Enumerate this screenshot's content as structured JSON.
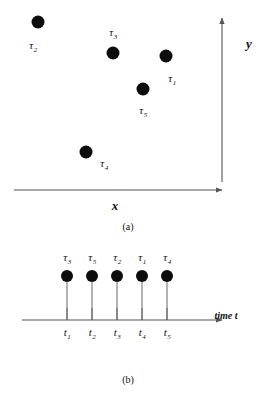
{
  "figure": {
    "background": "#ffffff",
    "ink": "#111111",
    "dot_color": "#0d0d0d",
    "axis_color": "#555555"
  },
  "panel_a": {
    "caption": "(a)",
    "x_axis_label": "x",
    "y_axis_label": "y",
    "points": [
      {
        "id": "tau-2",
        "label": "τ",
        "subscript": "2",
        "x": 38,
        "y": 22,
        "label_x": 33,
        "label_y": 45
      },
      {
        "id": "tau-3",
        "label": "τ",
        "subscript": "3",
        "x": 113,
        "y": 53,
        "label_x": 113,
        "label_y": 32
      },
      {
        "id": "tau-1",
        "label": "τ",
        "subscript": "1",
        "x": 166,
        "y": 56,
        "label_x": 172,
        "label_y": 78
      },
      {
        "id": "tau-5",
        "label": "τ",
        "subscript": "5",
        "x": 143,
        "y": 89,
        "label_x": 143,
        "label_y": 110
      },
      {
        "id": "tau-4",
        "label": "τ",
        "subscript": "4",
        "x": 86,
        "y": 152,
        "label_x": 104,
        "label_y": 163
      }
    ],
    "x_axis_name_pos": {
      "x": 115,
      "y": 205
    },
    "y_axis_name_pos": {
      "x": 249,
      "y": 43
    },
    "caption_pos": {
      "x": 128,
      "y": 227
    }
  },
  "panel_b": {
    "caption": "(b)",
    "time_axis_label": "time t",
    "events": [
      {
        "id": "event-1",
        "tau_label": "τ",
        "tau_subscript": "3",
        "tick_label": "t",
        "tick_subscript": "1",
        "x": 67
      },
      {
        "id": "event-2",
        "tau_label": "τ",
        "tau_subscript": "5",
        "tick_label": "t",
        "tick_subscript": "2",
        "x": 92
      },
      {
        "id": "event-3",
        "tau_label": "τ",
        "tau_subscript": "2",
        "tick_label": "t",
        "tick_subscript": "3",
        "x": 117
      },
      {
        "id": "event-4",
        "tau_label": "τ",
        "tau_subscript": "1",
        "tick_label": "t",
        "tick_subscript": "4",
        "x": 142
      },
      {
        "id": "event-5",
        "tau_label": "τ",
        "tau_subscript": "4",
        "tick_label": "t",
        "tick_subscript": "5",
        "x": 167
      }
    ],
    "dot_y": 44,
    "tau_label_y": 25,
    "axis_y": 88,
    "tick_top": 76,
    "tick_label_y": 100,
    "time_label_pos": {
      "x": 226,
      "y": 84
    },
    "caption_pos": {
      "x": 128,
      "y": 148
    }
  }
}
